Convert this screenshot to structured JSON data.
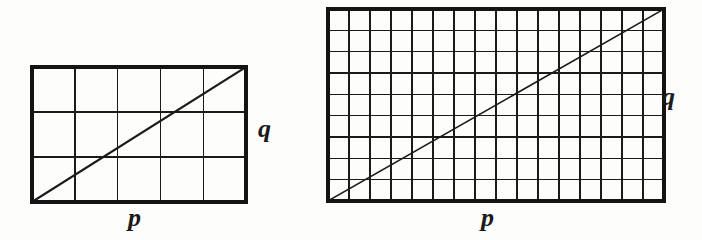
{
  "figure": {
    "background_color": "#fdfdfb",
    "line_color": "#1a1a1a",
    "border_color": "#141414",
    "panels": [
      {
        "id": "left-panel",
        "name": "coarse-grid",
        "columns": 5,
        "rows": 3,
        "x": 32,
        "y": 67,
        "width": 214,
        "height": 135,
        "diagonal": {
          "from": "bottom-left",
          "to": "top-right"
        },
        "labels": {
          "horizontal": "p",
          "vertical": "q"
        },
        "label_positions": {
          "p": {
            "x": 128,
            "y": 205
          },
          "q": {
            "x": 258,
            "y": 116
          }
        }
      },
      {
        "id": "right-panel",
        "name": "fine-grid",
        "columns": 16,
        "rows": 9,
        "x": 328,
        "y": 9,
        "width": 336,
        "height": 192,
        "diagonal": {
          "from": "bottom-left",
          "to": "top-right"
        },
        "labels": {
          "horizontal": "p",
          "vertical": "q"
        },
        "label_positions": {
          "p": {
            "x": 481,
            "y": 205
          },
          "q": {
            "x": 662,
            "y": 84
          }
        }
      }
    ]
  },
  "chart_data": {
    "type": "line",
    "title": "",
    "subtitle": "",
    "xlabel": "p",
    "ylabel": "q",
    "grid": true,
    "legend": null,
    "panels": [
      {
        "name": "coarse-grid",
        "grid_columns": 5,
        "grid_rows": 3,
        "xlim": [
          0,
          5
        ],
        "ylim": [
          0,
          3
        ],
        "series": [
          {
            "name": "diagonal",
            "x": [
              0,
              5
            ],
            "y": [
              0,
              3
            ]
          }
        ]
      },
      {
        "name": "fine-grid",
        "grid_columns": 16,
        "grid_rows": 9,
        "xlim": [
          0,
          16
        ],
        "ylim": [
          0,
          9
        ],
        "series": [
          {
            "name": "diagonal",
            "x": [
              0,
              16
            ],
            "y": [
              0,
              9
            ]
          }
        ]
      }
    ]
  }
}
